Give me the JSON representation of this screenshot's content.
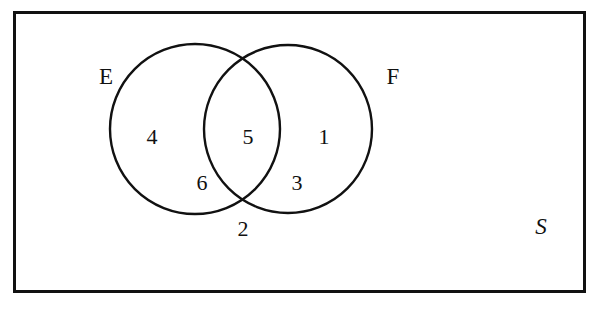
{
  "diagram": {
    "type": "venn-2set",
    "colors": {
      "stroke": "#111111",
      "background": "#ffffff",
      "text": "#111111"
    },
    "universe": {
      "label": "S",
      "label_style": "italic",
      "rect": {
        "x": 13,
        "y": 11,
        "width": 573,
        "height": 282,
        "stroke_width": 3
      },
      "label_position": {
        "x": 541,
        "y": 228
      }
    },
    "circles": [
      {
        "name": "E",
        "label": "E",
        "label_position": {
          "x": 106,
          "y": 78
        },
        "center": {
          "x": 195,
          "y": 129
        },
        "radius": 85,
        "stroke_width": 2.4
      },
      {
        "name": "F",
        "label": "F",
        "label_position": {
          "x": 393,
          "y": 78
        },
        "center": {
          "x": 288,
          "y": 129
        },
        "radius": 84,
        "stroke_width": 2.4
      }
    ],
    "regions": [
      {
        "id": "e-only-upper",
        "value": "4",
        "description": "inside E only",
        "x": 152,
        "y": 138
      },
      {
        "id": "intersection",
        "value": "5",
        "description": "inside both E and F",
        "x": 248,
        "y": 138
      },
      {
        "id": "f-only-upper",
        "value": "1",
        "description": "inside F only",
        "x": 324,
        "y": 138
      },
      {
        "id": "e-only-lower",
        "value": "6",
        "description": "inside E only, lower",
        "x": 202,
        "y": 184
      },
      {
        "id": "f-only-lower",
        "value": "3",
        "description": "inside F only, lower",
        "x": 297,
        "y": 184
      },
      {
        "id": "outside-both",
        "value": "2",
        "description": "outside both circles, inside S",
        "x": 243,
        "y": 230
      }
    ]
  }
}
